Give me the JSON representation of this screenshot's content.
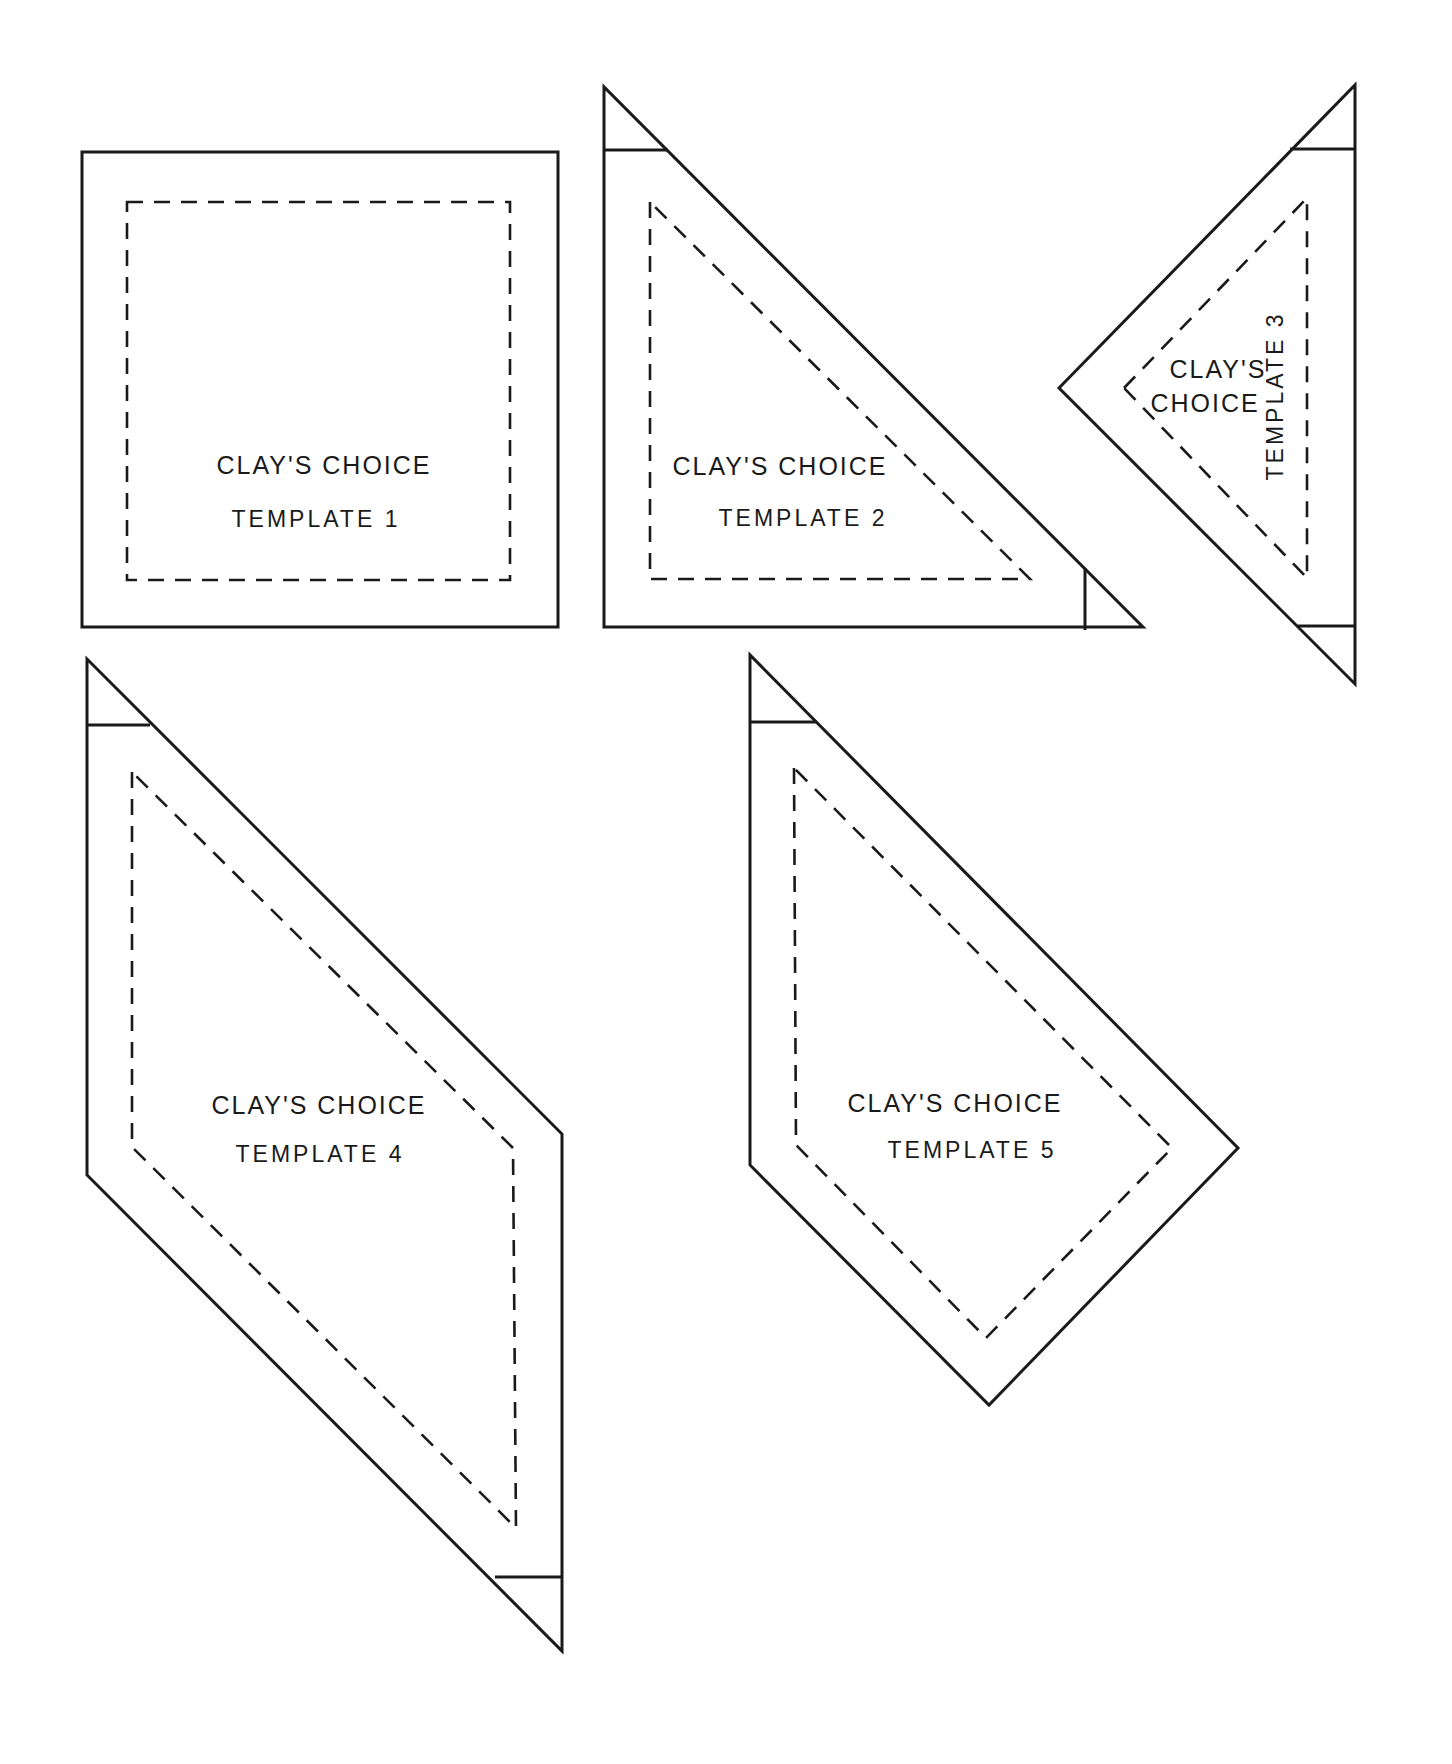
{
  "page": {
    "background": "#ffffff",
    "line_color": "#1a1a1a"
  },
  "templates": [
    {
      "id": 1,
      "title": "CLAY'S CHOICE",
      "label": "TEMPLATE 1",
      "shape": "square"
    },
    {
      "id": 2,
      "title": "CLAY'S CHOICE",
      "label": "TEMPLATE 2",
      "shape": "right-triangle"
    },
    {
      "id": 3,
      "title_line1": "CLAY'S",
      "title_line2": "CHOICE",
      "label": "TEMPLATE 3",
      "shape": "triangle",
      "label_orientation": "vertical"
    },
    {
      "id": 4,
      "title": "CLAY'S CHOICE",
      "label": "TEMPLATE 4",
      "shape": "parallelogram"
    },
    {
      "id": 5,
      "title": "CLAY'S CHOICE",
      "label": "TEMPLATE 5",
      "shape": "pentagon"
    }
  ],
  "legend": {
    "solid_line": "cutting line",
    "dashed_line": "seam line"
  }
}
